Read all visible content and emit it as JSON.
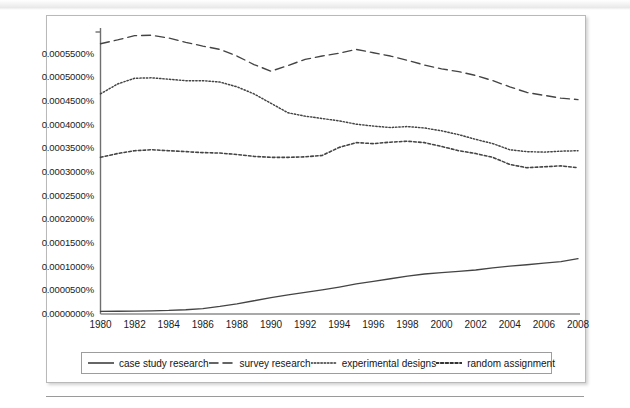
{
  "figure": {
    "accent_color": "#3a3a3a",
    "frame_color": "#b9b9b9"
  },
  "chart_data": {
    "type": "line",
    "title": "",
    "xlabel": "",
    "ylabel": "",
    "xlim": [
      1980,
      2008
    ],
    "ylim": [
      0.0,
      0.0006
    ],
    "grid": false,
    "legend_position": "bottom",
    "x": [
      1980,
      1981,
      1982,
      1983,
      1984,
      1985,
      1986,
      1987,
      1988,
      1989,
      1990,
      1991,
      1992,
      1993,
      1994,
      1995,
      1996,
      1997,
      1998,
      1999,
      2000,
      2001,
      2002,
      2003,
      2004,
      2005,
      2006,
      2007,
      2008
    ],
    "xtick_labels": [
      "1980",
      "1982",
      "1984",
      "1986",
      "1988",
      "1990",
      "1992",
      "1994",
      "1996",
      "1998",
      "2000",
      "2002",
      "2004",
      "2006",
      "2008"
    ],
    "ytick_labels": [
      "0.0005500%",
      "0.0005000%",
      "0.0004500%",
      "0.0004000%",
      "0.0003500%",
      "0.0003000%",
      "0.0002500%",
      "0.0002000%",
      "0.0001500%",
      "0.0001000%",
      "0.0000500%",
      "0.0000000%"
    ],
    "ytick_values": [
      0.00055,
      0.0005,
      0.00045,
      0.0004,
      0.00035,
      0.0003,
      0.00025,
      0.0002,
      0.00015,
      0.0001,
      5e-05,
      0.0
    ],
    "series": [
      {
        "name": "case study research",
        "style": "solid",
        "values": [
          5.5e-06,
          5.8e-06,
          6.2e-06,
          6.8e-06,
          7.5e-06,
          9e-06,
          1.15e-05,
          1.6e-05,
          2.15e-05,
          2.8e-05,
          3.45e-05,
          4.05e-05,
          4.55e-05,
          5.1e-05,
          5.7e-05,
          6.35e-05,
          6.9e-05,
          7.45e-05,
          8e-05,
          8.45e-05,
          8.75e-05,
          9e-05,
          9.3e-05,
          9.75e-05,
          0.000101,
          0.000104,
          0.0001075,
          0.0001105,
          0.000117
        ]
      },
      {
        "name": "survey research",
        "style": "dashed",
        "values": [
          0.000571,
          0.000579,
          0.000588,
          0.000589,
          0.000583,
          0.000574,
          0.000566,
          0.000559,
          0.000545,
          0.000527,
          0.000513,
          0.000525,
          0.000538,
          0.000545,
          0.000551,
          0.000559,
          0.000552,
          0.000545,
          0.000536,
          0.000526,
          0.000518,
          0.000512,
          0.000504,
          0.000493,
          0.00048,
          0.000468,
          0.000462,
          0.000456,
          0.000453
        ]
      },
      {
        "name": "experimental designs",
        "style": "dotted",
        "values": [
          0.000465,
          0.000486,
          0.000498,
          0.000499,
          0.000496,
          0.000493,
          0.000493,
          0.00049,
          0.00048,
          0.000465,
          0.000445,
          0.000425,
          0.000418,
          0.000413,
          0.000408,
          0.000401,
          0.000397,
          0.000394,
          0.000396,
          0.000393,
          0.000387,
          0.000379,
          0.000369,
          0.00036,
          0.000347,
          0.000343,
          0.000342,
          0.000344,
          0.000345
        ]
      },
      {
        "name": "random assignment",
        "style": "dash-dot",
        "values": [
          0.000331,
          0.000339,
          0.000345,
          0.000347,
          0.000345,
          0.000343,
          0.000341,
          0.00034,
          0.000337,
          0.000333,
          0.000331,
          0.000331,
          0.000332,
          0.000335,
          0.000352,
          0.000362,
          0.00036,
          0.000363,
          0.000365,
          0.000362,
          0.000354,
          0.000345,
          0.000339,
          0.000331,
          0.000316,
          0.000309,
          0.000311,
          0.000313,
          0.000309
        ]
      }
    ]
  },
  "legend": {
    "items": [
      {
        "label": "case study research",
        "style": "solid"
      },
      {
        "label": "survey research",
        "style": "dashed"
      },
      {
        "label": "experimental designs",
        "style": "dotted"
      },
      {
        "label": "random assignment",
        "style": "dash-dot"
      }
    ]
  }
}
